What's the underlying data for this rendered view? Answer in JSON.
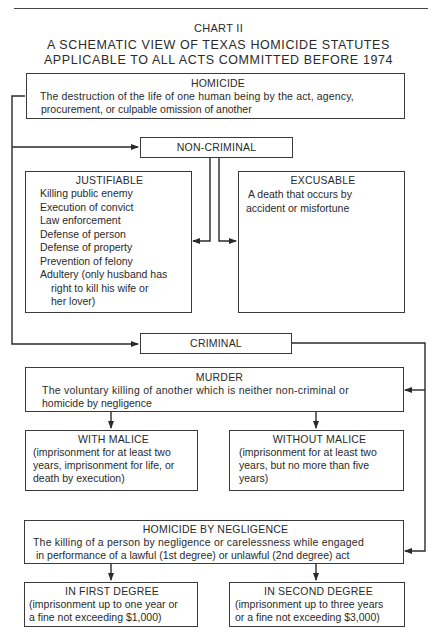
{
  "header": {
    "chart_label": "CHART II",
    "title_line1": "A SCHEMATIC VIEW OF TEXAS HOMICIDE STATUTES",
    "title_line2": "APPLICABLE TO ALL ACTS COMMITTED BEFORE 1974"
  },
  "homicide": {
    "heading": "HOMICIDE",
    "definition_line1": "The destruction of the life of one human being by the act, agency,",
    "definition_line2": "procurement, or culpable omission of another"
  },
  "non_criminal": {
    "label": "NON-CRIMINAL",
    "justifiable": {
      "heading": "JUSTIFIABLE",
      "items": [
        "Killing public enemy",
        "Execution of convict",
        "Law enforcement",
        "Defense of person",
        "Defense of property",
        "Prevention of felony",
        "Adultery (only husband has"
      ],
      "adultery_continuation_1": "right to kill his wife or",
      "adultery_continuation_2": "her lover)"
    },
    "excusable": {
      "heading": "EXCUSABLE",
      "line1": "A death that occurs by",
      "line2": "accident or misfortune"
    }
  },
  "criminal": {
    "label": "CRIMINAL",
    "murder": {
      "heading": "MURDER",
      "line1": "The voluntary killing of another which is neither non-criminal or",
      "line2": "homicide by negligence",
      "with_malice": {
        "heading": "WITH MALICE",
        "line1": "(imprisonment for at least two",
        "line2": "years, imprisonment for life, or",
        "line3": "death by execution)"
      },
      "without_malice": {
        "heading": "WITHOUT MALICE",
        "line1": "(imprisonment for at least two",
        "line2": "years, but no more than five",
        "line3": "years)"
      }
    },
    "negligence": {
      "heading": "HOMICIDE BY NEGLIGENCE",
      "line1": "The killing of a person by negligence or carelessness while engaged",
      "line2": "in performance of a lawful (1st degree) or unlawful (2nd degree) act",
      "first_degree": {
        "heading": "IN FIRST DEGREE",
        "line1": "(imprisonment up to one year or",
        "line2": "a fine not exceeding $1,000)"
      },
      "second_degree": {
        "heading": "IN SECOND DEGREE",
        "line1": "(imprisonment up to three years",
        "line2": "or a fine not exceeding $3,000)"
      }
    }
  }
}
